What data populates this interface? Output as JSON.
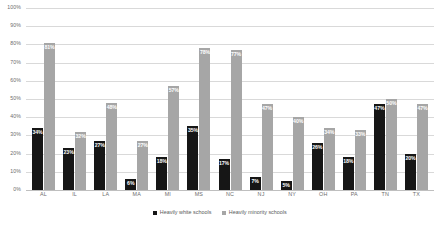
{
  "chart_data": {
    "type": "bar",
    "title": "",
    "xlabel": "",
    "ylabel": "",
    "ylim": [
      0,
      100
    ],
    "ytick_labels": [
      "100%",
      "90%",
      "80%",
      "70%",
      "60%",
      "50%",
      "40%",
      "30%",
      "20%",
      "10%",
      "0%"
    ],
    "ytick_values": [
      100,
      90,
      80,
      70,
      60,
      50,
      40,
      30,
      20,
      10,
      0
    ],
    "grid": true,
    "legend_position": "bottom-center",
    "categories": [
      "AL",
      "IL",
      "LA",
      "MA",
      "MI",
      "MS",
      "NC",
      "NJ",
      "NY",
      "OH",
      "PA",
      "TN",
      "TX"
    ],
    "series": [
      {
        "name": "Heavily white schools",
        "color": "#161616",
        "values": [
          34,
          23,
          27,
          6,
          18,
          35,
          17,
          7,
          5,
          26,
          18,
          47,
          20
        ],
        "labels": [
          "34%",
          "23%",
          "27%",
          "6%",
          "18%",
          "35%",
          "17%",
          "7%",
          "5%",
          "26%",
          "18%",
          "47%",
          "20%"
        ]
      },
      {
        "name": "Heavily minority schools",
        "color": "#a6a6a6",
        "values": [
          81,
          32,
          48,
          27,
          57,
          78,
          77,
          47,
          40,
          34,
          33,
          50,
          47
        ],
        "labels": [
          "81%",
          "32%",
          "48%",
          "27%",
          "57%",
          "78%",
          "77%",
          "47%",
          "40%",
          "34%",
          "33%",
          "50%",
          "47%"
        ]
      }
    ]
  }
}
